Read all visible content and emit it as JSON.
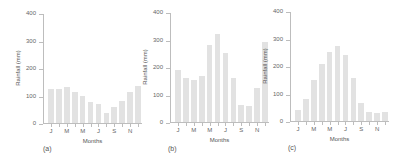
{
  "chart_data": [
    {
      "type": "bar",
      "title": "",
      "caption": "(a)",
      "xlabel": "Months",
      "ylabel": "Rainfall (mm)",
      "ylim": [
        0,
        400
      ],
      "yticks": [
        0,
        100,
        200,
        300,
        400
      ],
      "categories": [
        "J",
        "F",
        "M",
        "A",
        "M",
        "J",
        "J",
        "A",
        "S",
        "O",
        "N",
        "D"
      ],
      "xtick_labels": [
        "J",
        "M",
        "M",
        "J",
        "S",
        "N"
      ],
      "values": [
        128,
        128,
        133,
        117,
        103,
        80,
        72,
        40,
        63,
        85,
        118,
        140
      ],
      "grid": false,
      "bar_color": "#e2e2e2"
    },
    {
      "type": "bar",
      "title": "",
      "caption": "(b)",
      "xlabel": "Months",
      "ylabel": "Rainfall (mm)",
      "ylim": [
        0,
        400
      ],
      "yticks": [
        0,
        100,
        200,
        300,
        400
      ],
      "categories": [
        "J",
        "F",
        "M",
        "A",
        "M",
        "J",
        "J",
        "A",
        "S",
        "O",
        "N",
        "D"
      ],
      "xtick_labels": [
        "J",
        "M",
        "M",
        "J",
        "S",
        "N"
      ],
      "values": [
        193,
        165,
        157,
        170,
        283,
        325,
        253,
        165,
        67,
        62,
        127,
        295
      ],
      "grid": false,
      "bar_color": "#e2e2e2"
    },
    {
      "type": "bar",
      "title": "",
      "caption": "(c)",
      "xlabel": "Months",
      "ylabel": "Rainfall (mm)",
      "ylim": [
        0,
        400
      ],
      "yticks": [
        0,
        100,
        200,
        300,
        400
      ],
      "categories": [
        "J",
        "F",
        "M",
        "A",
        "M",
        "J",
        "J",
        "A",
        "S",
        "O",
        "N",
        "D"
      ],
      "xtick_labels": [
        "J",
        "M",
        "M",
        "J",
        "S",
        "N"
      ],
      "values": [
        45,
        85,
        153,
        210,
        255,
        275,
        245,
        160,
        70,
        35,
        33,
        37
      ],
      "grid": false,
      "bar_color": "#e2e2e2"
    }
  ],
  "layout": {
    "panels": [
      {
        "plot_left": 43,
        "plot_top": 14,
        "plot_width": 99,
        "plot_height": 110,
        "caption_x": 43,
        "caption_y": 145
      },
      {
        "plot_left": 170,
        "plot_top": 13,
        "plot_width": 99,
        "plot_height": 110,
        "caption_x": 168,
        "caption_y": 145
      },
      {
        "plot_left": 290,
        "plot_top": 12,
        "plot_width": 99,
        "plot_height": 110,
        "caption_x": 288,
        "caption_y": 144
      }
    ]
  }
}
